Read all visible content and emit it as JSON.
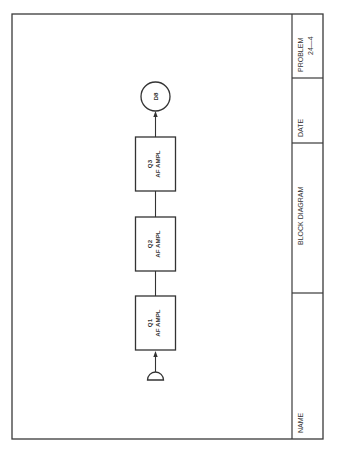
{
  "title_block": {
    "problem_label": "PROBLEM",
    "problem_number": "24—4",
    "date_label": "DATE",
    "title": "BLOCK DIAGRAM",
    "name_label": "NAME"
  },
  "diagram": {
    "input": {
      "symbol": "microphone",
      "label": ""
    },
    "stages": [
      {
        "id": "Q1",
        "label": "Q1",
        "function": "AF AMPL"
      },
      {
        "id": "Q2",
        "label": "Q2",
        "function": "AF AMPL"
      },
      {
        "id": "Q3",
        "label": "Q3",
        "function": "AF AMPL"
      }
    ],
    "output": {
      "label": "D8",
      "symbol": "circle"
    },
    "flow": [
      "microphone",
      "Q1",
      "Q2",
      "Q3",
      "D8"
    ],
    "colors": {
      "line": "#333333",
      "background": "#ffffff"
    }
  }
}
